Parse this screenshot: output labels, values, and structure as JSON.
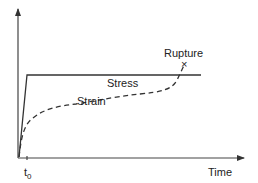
{
  "diagram": {
    "axes": {
      "x_label": "Time",
      "y_label": "",
      "origin_tick_label": "t",
      "origin_tick_subscript": "0"
    },
    "curves": [
      {
        "name": "Stress",
        "label": "Stress",
        "style": "solid"
      },
      {
        "name": "Strain",
        "label": "Strain",
        "style": "dashed"
      }
    ],
    "annotations": {
      "rupture_label": "Rupture",
      "rupture_marker": "×"
    },
    "colors": {
      "line": "#333333",
      "text": "#222222"
    }
  }
}
